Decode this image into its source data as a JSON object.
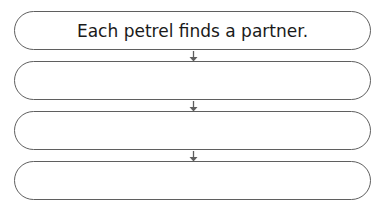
{
  "diagram": {
    "type": "flowchart",
    "direction": "top-to-bottom",
    "boxes": [
      {
        "label": "Each petrel finds a partner."
      },
      {
        "label": ""
      },
      {
        "label": ""
      },
      {
        "label": ""
      }
    ],
    "arrows": [
      {
        "from": 0,
        "to": 1
      },
      {
        "from": 1,
        "to": 2
      },
      {
        "from": 2,
        "to": 3
      }
    ],
    "colors": {
      "stroke": "#5f5f5f",
      "text": "#1a1a1a",
      "background": "#ffffff"
    }
  }
}
